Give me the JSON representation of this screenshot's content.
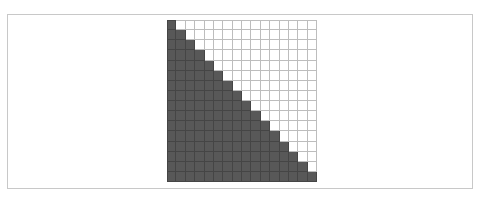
{
  "figure": {
    "type": "triangular-grid",
    "rows": 16,
    "cols": 16,
    "fill_rule": "lower-triangular-including-diagonal",
    "colors": {
      "filled": "#585858",
      "filled_line": "#454545",
      "empty": "#ffffff",
      "empty_line": "#bdbdbd",
      "frame": "#c8c8c8"
    }
  }
}
